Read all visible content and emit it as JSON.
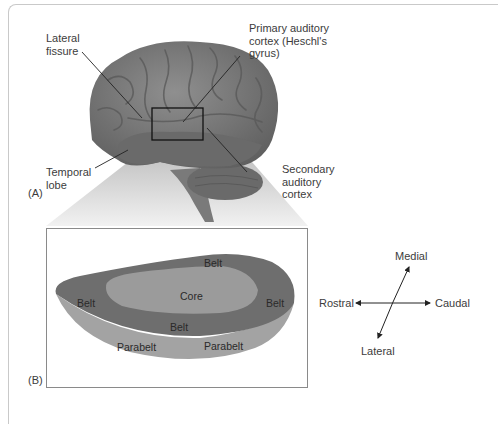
{
  "panel_a": {
    "tag": "(A)",
    "labels": {
      "lateral_fissure": "Lateral\nfissure",
      "primary_auditory_cortex": "Primary auditory\ncortex (Heschl's\ngyrus)",
      "temporal_lobe": "Temporal\nlobe",
      "secondary_auditory_cortex": "Secondary\nauditory\ncortex"
    }
  },
  "panel_b": {
    "tag": "(B)",
    "zones": {
      "belt_top": "Belt",
      "belt_left": "Belt",
      "core": "Core",
      "belt_right": "Belt",
      "belt_bottom": "Belt",
      "parabelt_left": "Parabelt",
      "parabelt_right": "Parabelt"
    },
    "colors": {
      "belt": "#6e6e6e",
      "core": "#9a9a9a",
      "parabelt": "#a3a3a3"
    }
  },
  "orientation": {
    "medial": "Medial",
    "lateral": "Lateral",
    "rostral": "Rostral",
    "caudal": "Caudal"
  }
}
